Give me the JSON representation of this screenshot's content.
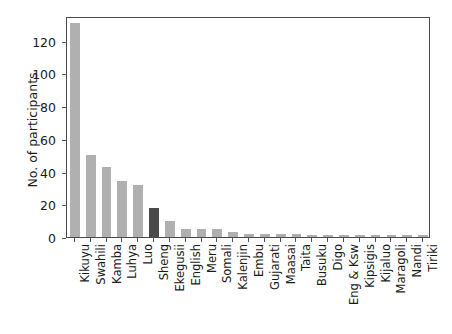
{
  "chart_data": {
    "type": "bar",
    "title": "",
    "xlabel": "",
    "ylabel": "No. of participants",
    "ylim": [
      0,
      135
    ],
    "yticks": [
      0,
      20,
      40,
      60,
      80,
      100,
      120
    ],
    "ytick_labels": [
      "0",
      "20",
      "40",
      "60",
      "80",
      "100",
      "120"
    ],
    "grid": false,
    "legend": null,
    "categories": [
      "Kikuyu",
      "Swahili",
      "Kamba",
      "Luhya",
      "Luo",
      "Sheng",
      "Ekegusii",
      "English",
      "Meru",
      "Somali",
      "Kalenjin",
      "Embu",
      "Gujarati",
      "Maasai",
      "Taita",
      "Busuku",
      "Digo",
      "Eng & Ksw",
      "Kipsigis",
      "Kijaluo",
      "Maragoli",
      "Nandi",
      "Tiriki"
    ],
    "values": [
      131,
      50,
      43,
      34,
      32,
      18,
      10,
      5,
      5,
      5,
      3,
      2,
      2,
      2,
      2,
      1,
      1,
      1,
      1,
      1,
      1,
      1,
      1
    ],
    "bar_color": "#b0b0b0",
    "highlight_color": "#4a4a4a",
    "highlight_category": "Sheng",
    "axis_color": "#4a4a4a",
    "text_color": "#1a1a1a"
  }
}
